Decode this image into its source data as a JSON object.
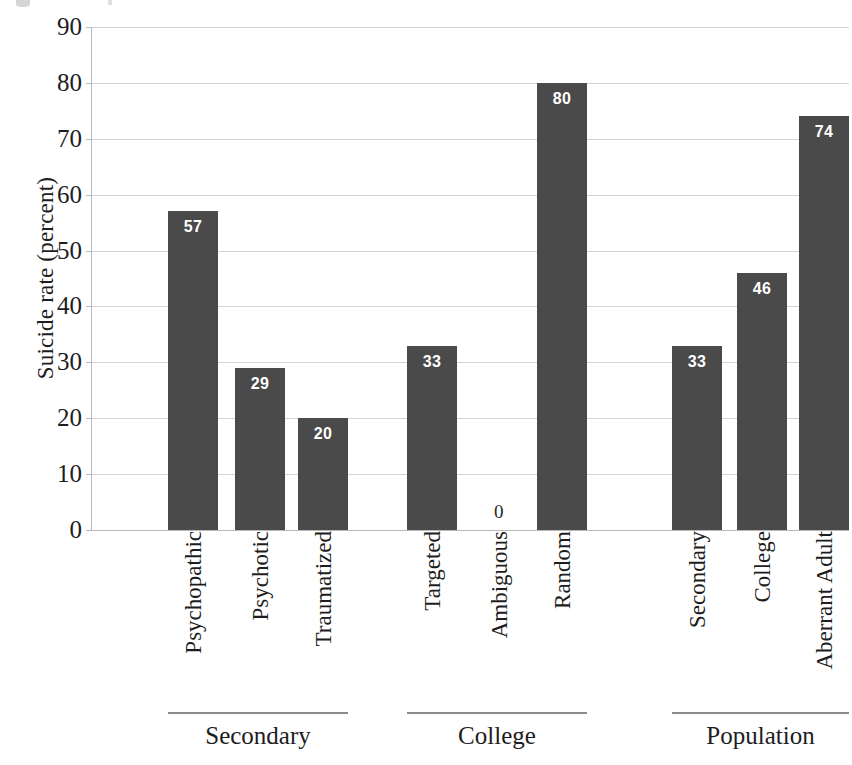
{
  "chart_data": {
    "type": "bar",
    "title": "",
    "xlabel": "",
    "ylabel": "Suicide rate (percent)",
    "ylim": [
      0,
      90
    ],
    "ytick_step": 10,
    "yticks": [
      90,
      80,
      70,
      60,
      50,
      40,
      30,
      20,
      10,
      0
    ],
    "grid": true,
    "legend": "none",
    "bar_color": "#4a4a4a",
    "value_label_color": "#ffffff",
    "categories": [
      "Psychopathic",
      "Psychotic",
      "Traumatized",
      "Targeted",
      "Ambiguous",
      "Random",
      "Secondary",
      "College",
      "Aberrant Adult"
    ],
    "values": [
      57,
      29,
      20,
      33,
      0,
      80,
      33,
      46,
      74
    ],
    "value_labels": [
      "57",
      "29",
      "20",
      "33",
      "0",
      "80",
      "33",
      "46",
      "74"
    ],
    "groups": [
      {
        "name": "Secondary",
        "categories": [
          "Psychopathic",
          "Psychotic",
          "Traumatized"
        ]
      },
      {
        "name": "College",
        "categories": [
          "Targeted",
          "Ambiguous",
          "Random"
        ]
      },
      {
        "name": "Population",
        "categories": [
          "Secondary",
          "College",
          "Aberrant Adult"
        ]
      }
    ]
  },
  "axis": {
    "y_title": "Suicide rate (percent)",
    "ticks": [
      "90",
      "80",
      "70",
      "60",
      "50",
      "40",
      "30",
      "20",
      "10",
      "0"
    ]
  },
  "bars": [
    {
      "label": "Psychopathic",
      "value": 57,
      "text": "57",
      "group": "Secondary"
    },
    {
      "label": "Psychotic",
      "value": 29,
      "text": "29",
      "group": "Secondary"
    },
    {
      "label": "Traumatized",
      "value": 20,
      "text": "20",
      "group": "Secondary"
    },
    {
      "label": "Targeted",
      "value": 33,
      "text": "33",
      "group": "College"
    },
    {
      "label": "Ambiguous",
      "value": 0,
      "text": "0",
      "group": "College"
    },
    {
      "label": "Random",
      "value": 80,
      "text": "80",
      "group": "College"
    },
    {
      "label": "Secondary",
      "value": 33,
      "text": "33",
      "group": "Population"
    },
    {
      "label": "College",
      "value": 46,
      "text": "46",
      "group": "Population"
    },
    {
      "label": "Aberrant Adult",
      "value": 74,
      "text": "74",
      "group": "Population"
    }
  ],
  "groups": [
    {
      "name": "Secondary"
    },
    {
      "name": "College"
    },
    {
      "name": "Population"
    }
  ]
}
